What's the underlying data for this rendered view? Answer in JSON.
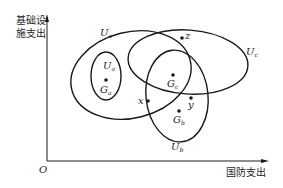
{
  "axes": {
    "y_label_line1": "基础设",
    "y_label_line2": "施支出",
    "x_label": "国防支出",
    "origin": "O"
  },
  "sets": {
    "ua_prime": {
      "main": "U",
      "sub": "a",
      "sup": "′"
    },
    "ua": {
      "main": "U",
      "sub": "a"
    },
    "uc": {
      "main": "U",
      "sub": "c"
    },
    "ub": {
      "main": "U",
      "sub": "b"
    }
  },
  "points": {
    "ga": {
      "main": "G",
      "sub": "a"
    },
    "gc": {
      "main": "G",
      "sub": "c"
    },
    "gb": {
      "main": "G",
      "sub": "b"
    },
    "x": "x",
    "y": "y",
    "z": "z"
  },
  "colors": {
    "stroke": "#1a1a1a",
    "text": "#222222"
  }
}
